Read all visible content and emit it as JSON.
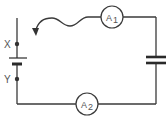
{
  "diagram": {
    "type": "circuit",
    "components": {
      "ammeter_top": {
        "label": "A",
        "subscript": "1"
      },
      "ammeter_bottom": {
        "label": "A",
        "subscript": "2"
      },
      "terminal_x": {
        "label": "X"
      },
      "terminal_y": {
        "label": "Y"
      },
      "cell": {
        "kind": "battery"
      },
      "capacitor": {
        "kind": "capacitor"
      },
      "flying_lead": {
        "kind": "wavy wire with arrow"
      }
    },
    "colors": {
      "line": "#3a3a3a",
      "text": "#555555",
      "background": "#ffffff"
    }
  }
}
